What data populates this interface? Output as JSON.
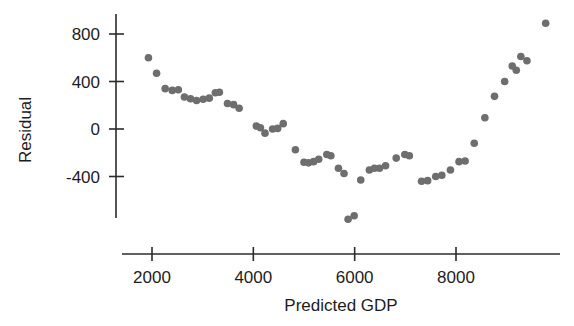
{
  "chart_data": {
    "type": "scatter",
    "title": "",
    "xlabel": "Predicted GDP",
    "ylabel": "Residual",
    "xlim": [
      1400,
      9950
    ],
    "ylim": [
      -900,
      1000
    ],
    "xticks": [
      2000,
      4000,
      6000,
      8000
    ],
    "xticklabels": [
      "2000",
      "4000",
      "6000",
      "8000"
    ],
    "yticks": [
      -400,
      0,
      400,
      800
    ],
    "yticklabels": [
      "-400",
      "0",
      "400",
      "800"
    ],
    "grid": false,
    "legend": null,
    "marker": {
      "shape": "circle",
      "color": "#6e6e6e",
      "size": 7.6
    },
    "points": [
      {
        "x": 1930,
        "y": 600
      },
      {
        "x": 2090,
        "y": 470
      },
      {
        "x": 2260,
        "y": 340
      },
      {
        "x": 2400,
        "y": 325
      },
      {
        "x": 2520,
        "y": 330
      },
      {
        "x": 2640,
        "y": 270
      },
      {
        "x": 2760,
        "y": 255
      },
      {
        "x": 2880,
        "y": 240
      },
      {
        "x": 3010,
        "y": 250
      },
      {
        "x": 3130,
        "y": 260
      },
      {
        "x": 3250,
        "y": 305
      },
      {
        "x": 3330,
        "y": 310
      },
      {
        "x": 3490,
        "y": 215
      },
      {
        "x": 3610,
        "y": 205
      },
      {
        "x": 3720,
        "y": 175
      },
      {
        "x": 4060,
        "y": 25
      },
      {
        "x": 4140,
        "y": 10
      },
      {
        "x": 4230,
        "y": -35
      },
      {
        "x": 4380,
        "y": 0
      },
      {
        "x": 4480,
        "y": 5
      },
      {
        "x": 4590,
        "y": 45
      },
      {
        "x": 4830,
        "y": -175
      },
      {
        "x": 5000,
        "y": -280
      },
      {
        "x": 5090,
        "y": -285
      },
      {
        "x": 5190,
        "y": -275
      },
      {
        "x": 5290,
        "y": -255
      },
      {
        "x": 5450,
        "y": -215
      },
      {
        "x": 5530,
        "y": -225
      },
      {
        "x": 5680,
        "y": -330
      },
      {
        "x": 5790,
        "y": -375
      },
      {
        "x": 5870,
        "y": -760
      },
      {
        "x": 5990,
        "y": -730
      },
      {
        "x": 6120,
        "y": -430
      },
      {
        "x": 6290,
        "y": -345
      },
      {
        "x": 6390,
        "y": -330
      },
      {
        "x": 6490,
        "y": -330
      },
      {
        "x": 6610,
        "y": -310
      },
      {
        "x": 6820,
        "y": -245
      },
      {
        "x": 6990,
        "y": -215
      },
      {
        "x": 7080,
        "y": -225
      },
      {
        "x": 7320,
        "y": -440
      },
      {
        "x": 7440,
        "y": -435
      },
      {
        "x": 7600,
        "y": -400
      },
      {
        "x": 7720,
        "y": -390
      },
      {
        "x": 7890,
        "y": -345
      },
      {
        "x": 8060,
        "y": -275
      },
      {
        "x": 8180,
        "y": -270
      },
      {
        "x": 8360,
        "y": -120
      },
      {
        "x": 8570,
        "y": 95
      },
      {
        "x": 8760,
        "y": 275
      },
      {
        "x": 8960,
        "y": 400
      },
      {
        "x": 9110,
        "y": 530
      },
      {
        "x": 9190,
        "y": 495
      },
      {
        "x": 9280,
        "y": 610
      },
      {
        "x": 9400,
        "y": 575
      },
      {
        "x": 9770,
        "y": 890
      }
    ]
  },
  "axes": {
    "x_axis_name": "x-axis",
    "y_axis_name": "y-axis"
  }
}
